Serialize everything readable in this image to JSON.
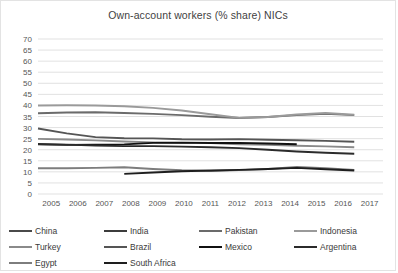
{
  "chart": {
    "title": "Own-account workers (% share) NICs"
  },
  "chart_data": {
    "type": "line",
    "title": "Own-account workers (% share) NICs",
    "xlabel": "",
    "ylabel": "",
    "x": [
      2005,
      2006,
      2007,
      2008,
      2009,
      2010,
      2011,
      2012,
      2013,
      2014,
      2015,
      2016,
      2017
    ],
    "xlim": [
      2005,
      2017
    ],
    "ylim": [
      0,
      70
    ],
    "ytick_step": 5,
    "yticks": [
      0,
      5,
      10,
      15,
      20,
      25,
      30,
      35,
      40,
      45,
      50,
      55,
      60,
      65,
      70
    ],
    "grid": true,
    "legend_position": "bottom",
    "series": [
      {
        "name": "China",
        "color": "#4a4a4a",
        "values": [
          null,
          null,
          null,
          null,
          null,
          null,
          null,
          null,
          null,
          null,
          null,
          null,
          null
        ]
      },
      {
        "name": "India",
        "color": "#3c3c3c",
        "values": [
          null,
          null,
          null,
          null,
          null,
          null,
          null,
          null,
          null,
          null,
          null,
          null,
          null
        ]
      },
      {
        "name": "Pakistan",
        "color": "#6b6b6b",
        "values": [
          36.5,
          36.8,
          36.9,
          36.6,
          36.2,
          35.6,
          34.9,
          34.3,
          34.8,
          35.6,
          36.2,
          35.6,
          null
        ]
      },
      {
        "name": "Indonesia",
        "color": "#9a9a9a",
        "values": [
          40.0,
          40.1,
          40.0,
          39.6,
          38.9,
          37.7,
          36.0,
          34.4,
          34.8,
          35.9,
          36.6,
          35.8,
          null
        ]
      },
      {
        "name": "Turkey",
        "color": "#8a8a8a",
        "values": [
          24.9,
          24.6,
          24.2,
          23.7,
          23.3,
          23.1,
          23.0,
          22.5,
          22.2,
          21.8,
          21.5,
          21.1,
          null
        ]
      },
      {
        "name": "Brazil",
        "color": "#555555",
        "values": [
          29.6,
          27.4,
          25.7,
          25.2,
          25.1,
          24.7,
          24.6,
          24.8,
          24.5,
          24.3,
          24.0,
          23.6,
          null
        ]
      },
      {
        "name": "Mexico",
        "color": "#111111",
        "values": [
          22.4,
          22.2,
          22.3,
          22.4,
          23.1,
          23.2,
          23.0,
          23.1,
          22.8,
          22.5,
          null,
          null,
          null
        ]
      },
      {
        "name": "Argentina",
        "color": "#2b2b2b",
        "values": [
          22.6,
          22.3,
          21.9,
          21.6,
          21.6,
          21.4,
          21.1,
          20.7,
          20.0,
          19.2,
          18.6,
          18.2,
          null
        ]
      },
      {
        "name": "Egypt",
        "color": "#7d7d7d",
        "values": [
          11.6,
          11.6,
          11.8,
          12.1,
          11.3,
          10.7,
          10.4,
          10.8,
          11.3,
          12.2,
          11.6,
          10.9,
          null
        ]
      },
      {
        "name": "South Africa",
        "color": "#1e1e1e",
        "values": [
          null,
          null,
          null,
          9.1,
          9.7,
          10.3,
          10.6,
          10.9,
          11.3,
          11.8,
          11.2,
          10.6,
          null
        ]
      }
    ]
  }
}
